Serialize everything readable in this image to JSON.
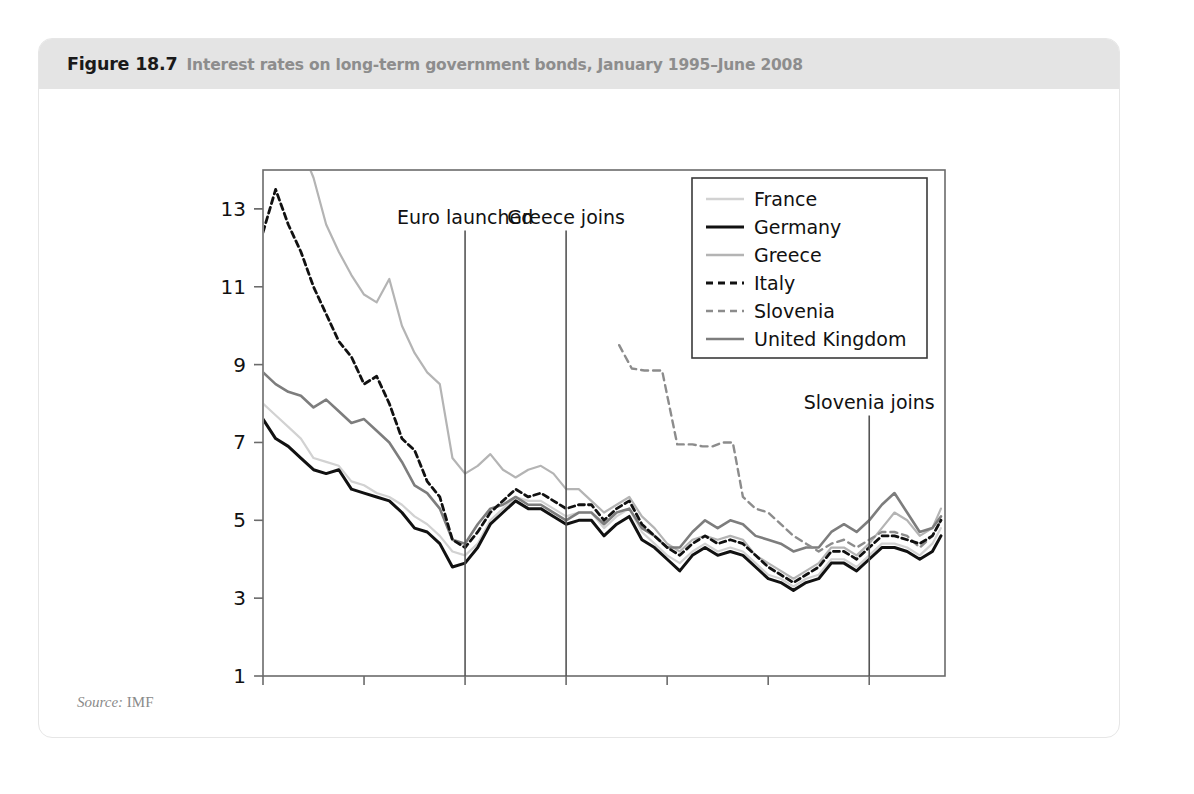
{
  "figure": {
    "number": "Figure 18.7",
    "title": "Interest rates on long-term government bonds, January 1995–June 2008",
    "source_label": "Source:",
    "source_value": "IMF"
  },
  "chart_data": {
    "type": "line",
    "title": "Interest rates on long-term government bonds, January 1995–June 2008",
    "xlabel": "",
    "ylabel": "",
    "grid": false,
    "legend_position": "top-right",
    "xlim": [
      1995.0,
      2008.5
    ],
    "ylim": [
      1,
      14
    ],
    "yticks": [
      1,
      3,
      5,
      7,
      9,
      11,
      13
    ],
    "xticks": [
      1995,
      1997,
      1999,
      2001,
      2003,
      2005,
      2007
    ],
    "xtick_labels": [
      "1995M1",
      "1997M1",
      "1999M1",
      "2001M1",
      "2003M1",
      "2005M1",
      "2007M1"
    ],
    "colors": {
      "france": "#d2d2d2",
      "germany": "#111111",
      "greece": "#b4b4b4",
      "italy": "#111111",
      "slovenia": "#8c8c8c",
      "united_kingdom": "#7d7d7d"
    },
    "annotations": [
      {
        "name": "euro-launched",
        "label": "Euro launched",
        "x": 1999.0,
        "label_x": 1999.0,
        "label_y": 12.6
      },
      {
        "name": "greece-joins",
        "label": "Greece joins",
        "x": 2001.0,
        "label_x": 2001.0,
        "label_y": 12.6
      },
      {
        "name": "slovenia-joins",
        "label": "Slovenia joins",
        "x": 2007.0,
        "label_x": 2007.0,
        "label_y": 7.85
      }
    ],
    "series": [
      {
        "name": "France",
        "key": "france",
        "style": "solid",
        "color": "#d2d2d2",
        "width": 2.2,
        "x": [
          1995.0,
          1995.25,
          1995.5,
          1995.75,
          1996.0,
          1996.25,
          1996.5,
          1996.75,
          1997.0,
          1997.25,
          1997.5,
          1997.75,
          1998.0,
          1998.25,
          1998.5,
          1998.75,
          1999.0,
          1999.25,
          1999.5,
          1999.75,
          2000.0,
          2000.25,
          2000.5,
          2000.75,
          2001.0,
          2001.25,
          2001.5,
          2001.75,
          2002.0,
          2002.25,
          2002.5,
          2002.75,
          2003.0,
          2003.25,
          2003.5,
          2003.75,
          2004.0,
          2004.25,
          2004.5,
          2004.75,
          2005.0,
          2005.25,
          2005.5,
          2005.75,
          2006.0,
          2006.25,
          2006.5,
          2006.75,
          2007.0,
          2007.25,
          2007.5,
          2007.75,
          2008.0,
          2008.25,
          2008.42
        ],
        "y": [
          8.0,
          7.7,
          7.4,
          7.1,
          6.6,
          6.5,
          6.4,
          6.0,
          5.9,
          5.7,
          5.6,
          5.4,
          5.1,
          4.9,
          4.6,
          4.2,
          4.1,
          4.4,
          5.0,
          5.3,
          5.6,
          5.5,
          5.5,
          5.3,
          5.1,
          5.2,
          5.2,
          4.8,
          5.1,
          5.3,
          4.7,
          4.4,
          4.1,
          3.9,
          4.2,
          4.4,
          4.2,
          4.3,
          4.2,
          3.9,
          3.6,
          3.5,
          3.3,
          3.5,
          3.6,
          4.0,
          4.0,
          3.8,
          4.1,
          4.4,
          4.4,
          4.3,
          4.1,
          4.4,
          4.8
        ]
      },
      {
        "name": "Germany",
        "key": "germany",
        "style": "solid",
        "color": "#111111",
        "width": 3.0,
        "x": [
          1995.0,
          1995.25,
          1995.5,
          1995.75,
          1996.0,
          1996.25,
          1996.5,
          1996.75,
          1997.0,
          1997.25,
          1997.5,
          1997.75,
          1998.0,
          1998.25,
          1998.5,
          1998.75,
          1999.0,
          1999.25,
          1999.5,
          1999.75,
          2000.0,
          2000.25,
          2000.5,
          2000.75,
          2001.0,
          2001.25,
          2001.5,
          2001.75,
          2002.0,
          2002.25,
          2002.5,
          2002.75,
          2003.0,
          2003.25,
          2003.5,
          2003.75,
          2004.0,
          2004.25,
          2004.5,
          2004.75,
          2005.0,
          2005.25,
          2005.5,
          2005.75,
          2006.0,
          2006.25,
          2006.5,
          2006.75,
          2007.0,
          2007.25,
          2007.5,
          2007.75,
          2008.0,
          2008.25,
          2008.42
        ],
        "y": [
          7.6,
          7.1,
          6.9,
          6.6,
          6.3,
          6.2,
          6.3,
          5.8,
          5.7,
          5.6,
          5.5,
          5.2,
          4.8,
          4.7,
          4.4,
          3.8,
          3.9,
          4.3,
          4.9,
          5.2,
          5.5,
          5.3,
          5.3,
          5.1,
          4.9,
          5.0,
          5.0,
          4.6,
          4.9,
          5.1,
          4.5,
          4.3,
          4.0,
          3.7,
          4.1,
          4.3,
          4.1,
          4.2,
          4.1,
          3.8,
          3.5,
          3.4,
          3.2,
          3.4,
          3.5,
          3.9,
          3.9,
          3.7,
          4.0,
          4.3,
          4.3,
          4.2,
          4.0,
          4.2,
          4.6
        ]
      },
      {
        "name": "Greece",
        "key": "greece",
        "style": "solid",
        "color": "#b4b4b4",
        "width": 2.2,
        "x": [
          1995.0,
          1995.25,
          1995.5,
          1995.75,
          1996.0,
          1996.25,
          1996.5,
          1996.75,
          1997.0,
          1997.25,
          1997.5,
          1997.75,
          1998.0,
          1998.25,
          1998.5,
          1998.75,
          1999.0,
          1999.25,
          1999.5,
          1999.75,
          2000.0,
          2000.25,
          2000.5,
          2000.75,
          2001.0,
          2001.25,
          2001.5,
          2001.75,
          2002.0,
          2002.25,
          2002.5,
          2002.75,
          2003.0,
          2003.25,
          2003.5,
          2003.75,
          2004.0,
          2004.25,
          2004.5,
          2004.75,
          2005.0,
          2005.25,
          2005.5,
          2005.75,
          2006.0,
          2006.25,
          2006.5,
          2006.75,
          2007.0,
          2007.25,
          2007.5,
          2007.75,
          2008.0,
          2008.25,
          2008.42
        ],
        "y": [
          17.0,
          15.8,
          15.2,
          14.6,
          13.8,
          12.6,
          11.9,
          11.3,
          10.8,
          10.6,
          11.2,
          10.0,
          9.3,
          8.8,
          8.5,
          6.6,
          6.2,
          6.4,
          6.7,
          6.3,
          6.1,
          6.3,
          6.4,
          6.2,
          5.8,
          5.8,
          5.5,
          5.2,
          5.4,
          5.6,
          5.1,
          4.8,
          4.4,
          4.2,
          4.5,
          4.6,
          4.5,
          4.6,
          4.5,
          4.1,
          3.9,
          3.7,
          3.5,
          3.7,
          3.9,
          4.3,
          4.3,
          4.1,
          4.4,
          4.8,
          5.2,
          5.0,
          4.6,
          4.8,
          5.3
        ]
      },
      {
        "name": "Italy",
        "key": "italy",
        "style": "dashed",
        "color": "#111111",
        "width": 2.8,
        "x": [
          1995.0,
          1995.25,
          1995.5,
          1995.75,
          1996.0,
          1996.25,
          1996.5,
          1996.75,
          1997.0,
          1997.25,
          1997.5,
          1997.75,
          1998.0,
          1998.25,
          1998.5,
          1998.75,
          1999.0,
          1999.25,
          1999.5,
          1999.75,
          2000.0,
          2000.25,
          2000.5,
          2000.75,
          2001.0,
          2001.25,
          2001.5,
          2001.75,
          2002.0,
          2002.25,
          2002.5,
          2002.75,
          2003.0,
          2003.25,
          2003.5,
          2003.75,
          2004.0,
          2004.25,
          2004.5,
          2004.75,
          2005.0,
          2005.25,
          2005.5,
          2005.75,
          2006.0,
          2006.25,
          2006.5,
          2006.75,
          2007.0,
          2007.25,
          2007.5,
          2007.75,
          2008.0,
          2008.25,
          2008.42
        ],
        "y": [
          12.4,
          13.5,
          12.6,
          11.9,
          11.0,
          10.3,
          9.6,
          9.2,
          8.5,
          8.7,
          8.0,
          7.1,
          6.8,
          6.0,
          5.6,
          4.5,
          4.3,
          4.7,
          5.2,
          5.5,
          5.8,
          5.6,
          5.7,
          5.5,
          5.3,
          5.4,
          5.4,
          5.0,
          5.3,
          5.5,
          4.9,
          4.6,
          4.3,
          4.1,
          4.4,
          4.6,
          4.4,
          4.5,
          4.4,
          4.1,
          3.8,
          3.6,
          3.4,
          3.6,
          3.8,
          4.2,
          4.2,
          4.0,
          4.3,
          4.6,
          4.6,
          4.5,
          4.4,
          4.6,
          5.0
        ]
      },
      {
        "name": "Slovenia",
        "key": "slovenia",
        "style": "dashed",
        "color": "#8c8c8c",
        "width": 2.4,
        "x": [
          2002.05,
          2002.3,
          2002.55,
          2002.7,
          2002.9,
          2003.2,
          2003.5,
          2003.7,
          2003.9,
          2004.1,
          2004.3,
          2004.5,
          2004.75,
          2005.0,
          2005.25,
          2005.5,
          2005.75,
          2006.0,
          2006.25,
          2006.5,
          2006.75,
          2007.0,
          2007.25,
          2007.5,
          2007.75,
          2008.0,
          2008.25,
          2008.42
        ],
        "y": [
          9.5,
          8.9,
          8.85,
          8.85,
          8.85,
          6.95,
          6.95,
          6.9,
          6.9,
          7.0,
          7.0,
          5.6,
          5.3,
          5.2,
          4.9,
          4.6,
          4.4,
          4.2,
          4.4,
          4.5,
          4.3,
          4.5,
          4.7,
          4.7,
          4.6,
          4.3,
          4.6,
          5.0
        ]
      },
      {
        "name": "United Kingdom",
        "key": "united_kingdom",
        "style": "solid",
        "color": "#7d7d7d",
        "width": 2.6,
        "x": [
          1995.0,
          1995.25,
          1995.5,
          1995.75,
          1996.0,
          1996.25,
          1996.5,
          1996.75,
          1997.0,
          1997.25,
          1997.5,
          1997.75,
          1998.0,
          1998.25,
          1998.5,
          1998.75,
          1999.0,
          1999.25,
          1999.5,
          1999.75,
          2000.0,
          2000.25,
          2000.5,
          2000.75,
          2001.0,
          2001.25,
          2001.5,
          2001.75,
          2002.0,
          2002.25,
          2002.5,
          2002.75,
          2003.0,
          2003.25,
          2003.5,
          2003.75,
          2004.0,
          2004.25,
          2004.5,
          2004.75,
          2005.0,
          2005.25,
          2005.5,
          2005.75,
          2006.0,
          2006.25,
          2006.5,
          2006.75,
          2007.0,
          2007.25,
          2007.5,
          2007.75,
          2008.0,
          2008.25,
          2008.42
        ],
        "y": [
          8.8,
          8.5,
          8.3,
          8.2,
          7.9,
          8.1,
          7.8,
          7.5,
          7.6,
          7.3,
          7.0,
          6.5,
          5.9,
          5.7,
          5.3,
          4.5,
          4.4,
          4.9,
          5.3,
          5.4,
          5.6,
          5.4,
          5.4,
          5.2,
          5.0,
          5.2,
          5.2,
          4.9,
          5.2,
          5.3,
          4.8,
          4.6,
          4.3,
          4.3,
          4.7,
          5.0,
          4.8,
          5.0,
          4.9,
          4.6,
          4.5,
          4.4,
          4.2,
          4.3,
          4.3,
          4.7,
          4.9,
          4.7,
          5.0,
          5.4,
          5.7,
          5.2,
          4.7,
          4.8,
          5.1
        ]
      }
    ]
  }
}
